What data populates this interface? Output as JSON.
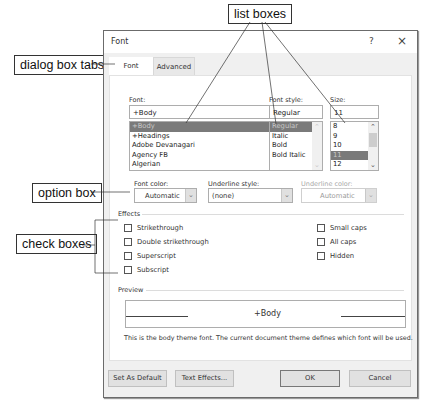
{
  "callouts": {
    "list_boxes": "list boxes",
    "dialog_box_tabs": "dialog box tabs",
    "option_box": "option box",
    "check_boxes": "check boxes"
  },
  "dialog": {
    "title": "Font",
    "help_glyph": "?",
    "close_glyph": "×",
    "tabs": [
      {
        "label": "Font",
        "active": true
      },
      {
        "label": "Advanced",
        "active": false
      }
    ]
  },
  "font": {
    "label": "Font:",
    "value": "+Body",
    "items": [
      "+Body",
      "+Headings",
      "Adobe Devanagari",
      "Agency FB",
      "Algerian"
    ],
    "selected_index": 0
  },
  "font_style": {
    "label": "Font style:",
    "value": "Regular",
    "items": [
      "Regular",
      "Italic",
      "Bold",
      "Bold Italic"
    ],
    "selected_index": 0
  },
  "size": {
    "label": "Size:",
    "value": "11",
    "items": [
      "8",
      "9",
      "10",
      "11",
      "12"
    ],
    "selected_index": 3
  },
  "font_color": {
    "label": "Font color:",
    "value": "Automatic"
  },
  "underline_style": {
    "label": "Underline style:",
    "value": "(none)"
  },
  "underline_color": {
    "label": "Underline color:",
    "value": "Automatic",
    "disabled": true
  },
  "effects": {
    "label": "Effects",
    "left": [
      {
        "label": "Strikethrough",
        "checked": false
      },
      {
        "label": "Double strikethrough",
        "checked": false
      },
      {
        "label": "Superscript",
        "checked": false
      },
      {
        "label": "Subscript",
        "checked": false
      }
    ],
    "right": [
      {
        "label": "Small caps",
        "checked": false
      },
      {
        "label": "All caps",
        "checked": false
      },
      {
        "label": "Hidden",
        "checked": false
      }
    ]
  },
  "preview": {
    "label": "Preview",
    "sample": "+Body",
    "description": "This is the body theme font. The current document theme defines which font will be used."
  },
  "buttons": {
    "set_default": "Set As Default",
    "text_effects": "Text Effects...",
    "ok": "OK",
    "cancel": "Cancel"
  }
}
